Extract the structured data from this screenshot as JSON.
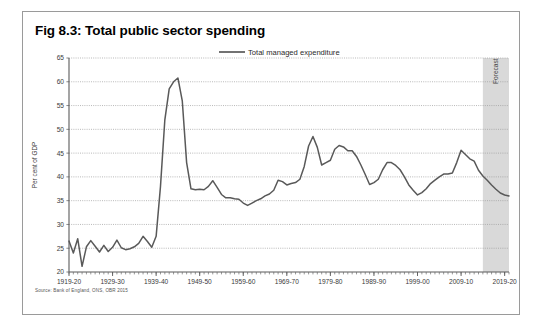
{
  "figure": {
    "title": "Fig 8.3: Total public sector spending",
    "source": "Source: Bank of England, ONS, OBR 2015"
  },
  "legend": {
    "position": "top-center",
    "entries": [
      {
        "label": "Total managed expenditure",
        "color": "#595959"
      }
    ]
  },
  "annotations": {
    "forecast_label": "Forecast",
    "forecast_band_color": "#d9d9d9",
    "forecast_start": "2014-15",
    "forecast_end": "2020-21"
  },
  "axes": {
    "y_title": "Per cent of GDP",
    "y_ticks": [
      "20",
      "25",
      "30",
      "35",
      "40",
      "45",
      "50",
      "55",
      "60",
      "65"
    ],
    "x_ticks": [
      "1919-20",
      "1929-30",
      "1939-40",
      "1949-50",
      "1959-60",
      "1969-70",
      "1979-80",
      "1989-90",
      "1999-00",
      "2009-10",
      "2019-20"
    ]
  },
  "chart_data": {
    "type": "line",
    "title": "Fig 8.3: Total public sector spending",
    "xlabel": "",
    "ylabel": "Per cent of GDP",
    "ylim": [
      20,
      65
    ],
    "xlim": [
      "1919-20",
      "2020-21"
    ],
    "grid": true,
    "grid_style": "dotted-horizontal",
    "legend_position": "top-center",
    "x_tick_labels": [
      "1919-20",
      "1929-30",
      "1939-40",
      "1949-50",
      "1959-60",
      "1969-70",
      "1979-80",
      "1989-90",
      "1999-00",
      "2009-10",
      "2019-20"
    ],
    "y_ticks": [
      20,
      25,
      30,
      35,
      40,
      45,
      50,
      55,
      60,
      65
    ],
    "shaded_region": {
      "label": "Forecast",
      "from": "2014-15",
      "to": "2020-21",
      "color": "#d9d9d9"
    },
    "series": [
      {
        "name": "Total managed expenditure",
        "color": "#595959",
        "x": [
          "1919-20",
          "1920-21",
          "1921-22",
          "1922-23",
          "1923-24",
          "1924-25",
          "1925-26",
          "1926-27",
          "1927-28",
          "1928-29",
          "1929-30",
          "1930-31",
          "1931-32",
          "1932-33",
          "1933-34",
          "1934-35",
          "1935-36",
          "1936-37",
          "1937-38",
          "1938-39",
          "1939-40",
          "1940-41",
          "1941-42",
          "1942-43",
          "1943-44",
          "1944-45",
          "1945-46",
          "1946-47",
          "1947-48",
          "1948-49",
          "1949-50",
          "1950-51",
          "1951-52",
          "1952-53",
          "1953-54",
          "1954-55",
          "1955-56",
          "1956-57",
          "1957-58",
          "1958-59",
          "1959-60",
          "1960-61",
          "1961-62",
          "1962-63",
          "1963-64",
          "1964-65",
          "1965-66",
          "1966-67",
          "1967-68",
          "1968-69",
          "1969-70",
          "1970-71",
          "1971-72",
          "1972-73",
          "1973-74",
          "1974-75",
          "1975-76",
          "1976-77",
          "1977-78",
          "1978-79",
          "1979-80",
          "1980-81",
          "1981-82",
          "1982-83",
          "1983-84",
          "1984-85",
          "1985-86",
          "1986-87",
          "1987-88",
          "1988-89",
          "1989-90",
          "1990-91",
          "1991-92",
          "1992-93",
          "1993-94",
          "1994-95",
          "1995-96",
          "1996-97",
          "1997-98",
          "1998-99",
          "1999-00",
          "2000-01",
          "2001-02",
          "2002-03",
          "2003-04",
          "2004-05",
          "2005-06",
          "2006-07",
          "2007-08",
          "2008-09",
          "2009-10",
          "2010-11",
          "2011-12",
          "2012-13",
          "2013-14",
          "2014-15",
          "2015-16",
          "2016-17",
          "2017-18",
          "2018-19",
          "2019-20",
          "2020-21"
        ],
        "y": [
          26.5,
          24.0,
          27.0,
          21.2,
          25.3,
          26.6,
          25.4,
          24.2,
          25.6,
          24.3,
          25.2,
          26.7,
          25.1,
          24.7,
          24.9,
          25.3,
          26.0,
          27.5,
          26.4,
          25.2,
          27.5,
          38.0,
          52.0,
          58.5,
          60.0,
          60.8,
          56.0,
          43.0,
          37.5,
          37.3,
          37.4,
          37.3,
          38.0,
          39.2,
          37.8,
          36.3,
          35.6,
          35.6,
          35.4,
          35.3,
          34.5,
          34.0,
          34.5,
          35.0,
          35.4,
          36.0,
          36.4,
          37.2,
          39.3,
          39.0,
          38.3,
          38.6,
          38.8,
          39.5,
          42.2,
          46.5,
          48.5,
          46.2,
          42.5,
          43.0,
          43.5,
          45.8,
          46.6,
          46.3,
          45.5,
          45.5,
          44.3,
          42.5,
          40.5,
          38.4,
          38.8,
          39.5,
          41.5,
          43.0,
          43.0,
          42.4,
          41.5,
          40.0,
          38.3,
          37.2,
          36.2,
          36.7,
          37.5,
          38.6,
          39.3,
          40.0,
          40.6,
          40.6,
          40.8,
          43.0,
          45.6,
          44.7,
          43.8,
          43.3,
          41.4,
          40.2,
          39.3,
          38.3,
          37.4,
          36.6,
          36.2,
          36.0
        ]
      }
    ]
  }
}
